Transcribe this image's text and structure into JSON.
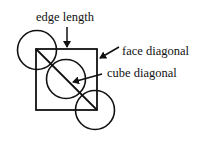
{
  "diagram": {
    "type": "unit-cell-cross-section",
    "labels": {
      "edge_length": "edge length",
      "face_diagonal": "face diagonal",
      "cube_diagonal": "cube diagonal"
    },
    "square": {
      "x": 36,
      "y": 49,
      "size": 61
    },
    "circles": [
      {
        "cx": 37,
        "cy": 50,
        "r": 19.5
      },
      {
        "cx": 66,
        "cy": 79,
        "r": 19.5
      },
      {
        "cx": 95,
        "cy": 110,
        "r": 19.5
      }
    ],
    "colors": {
      "stroke": "#111111",
      "background": "#ffffff"
    }
  }
}
